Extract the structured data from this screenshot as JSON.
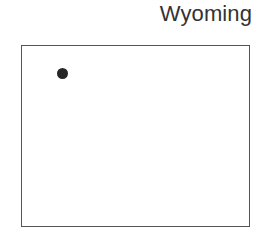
{
  "canvas": {
    "width": 265,
    "height": 250,
    "background": "#ffffff"
  },
  "title": {
    "text": "Wyoming",
    "color": "#333333",
    "align": "right",
    "font_size_px": 22
  },
  "chart_data": {
    "type": "scatter",
    "title": "Wyoming",
    "xlabel": "",
    "ylabel": "",
    "grid": false,
    "legend": null,
    "boundary": {
      "name": "wyoming-state-outline",
      "shape": "rectangle",
      "x": 21,
      "y": 45,
      "width": 229,
      "height": 182,
      "fill": "#ffffff",
      "stroke": "#555555",
      "stroke_width": 1
    },
    "series": [
      {
        "name": "locations",
        "marker": "circle",
        "marker_color": "#262626",
        "marker_size_px": 11,
        "points": [
          {
            "x": 62.5,
            "y": 73.5
          }
        ]
      }
    ],
    "point_count": 1
  }
}
